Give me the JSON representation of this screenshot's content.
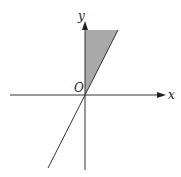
{
  "diagram": {
    "type": "coordinate-plane-region",
    "axes": {
      "x_label": "x",
      "y_label": "y",
      "origin_label": "O"
    },
    "shaded_region": {
      "description": "triangular region between positive y-axis and line through origin",
      "fill_color": "#a9a9a9",
      "vertices_px": [
        [
          85,
          30
        ],
        [
          118,
          30
        ],
        [
          85,
          95
        ]
      ]
    },
    "line": {
      "description": "line through origin with positive slope",
      "from_px": [
        118,
        30
      ],
      "to_px": [
        48,
        168
      ],
      "color": "#333333"
    },
    "colors": {
      "axis": "#333333",
      "background": "#ffffff"
    }
  }
}
